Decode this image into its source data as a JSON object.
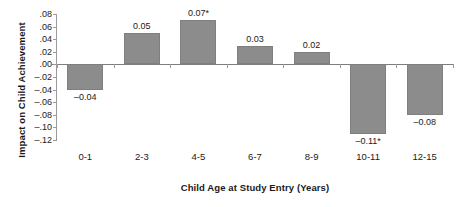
{
  "chart_data": {
    "type": "bar",
    "title": "",
    "subtitle": "",
    "xlabel": "Child Age at Study Entry (Years)",
    "ylabel": "Impact on Child Achievement",
    "categories": [
      "0-1",
      "2-3",
      "4-5",
      "6-7",
      "8-9",
      "10-11",
      "12-15"
    ],
    "values": [
      -0.04,
      0.05,
      0.07,
      0.03,
      0.02,
      -0.11,
      -0.08
    ],
    "data_labels": [
      "–0.04",
      "0.05",
      "0.07*",
      "0.03",
      "0.02",
      "–0.11*",
      "–0.08"
    ],
    "significance": [
      false,
      false,
      true,
      false,
      false,
      true,
      false
    ],
    "ylim": [
      -0.12,
      0.08
    ],
    "ytick_values": [
      0.08,
      0.06,
      0.04,
      0.02,
      0.0,
      -0.02,
      -0.04,
      -0.06,
      -0.08,
      -0.1,
      -0.12
    ],
    "ytick_labels": [
      ".08",
      ".06",
      ".04",
      ".02",
      ".00",
      "–.02",
      "–.04",
      "–.06",
      "–.08",
      "–.10",
      "–.12"
    ],
    "grid": false,
    "legend": null,
    "bar_color": "#8c8c8c",
    "bar_edge_color": "#7f7f7f",
    "axis_color": "#9a9a9a",
    "zero_line_color": "#7d7d7d",
    "text_color": "#1a1a1a",
    "background_color": "#ffffff"
  }
}
